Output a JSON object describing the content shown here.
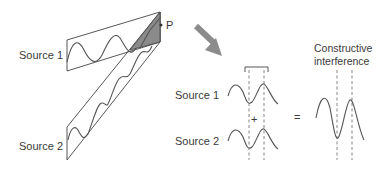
{
  "left_panel": {
    "source1_label": "Source 1",
    "source2_label": "Source 2",
    "point_label": "P"
  },
  "arrow": {
    "icon": "arrow-down-right-icon",
    "color": "#8c8c8c"
  },
  "right_panel": {
    "source1_label": "Source 1",
    "source2_label": "Source 2",
    "plus_sign": "+",
    "equals_sign": "=",
    "result_title_line1": "Constructive",
    "result_title_line2": "interference"
  },
  "colors": {
    "line": "#444444",
    "shading": "#8a8a8a",
    "arrow": "#8c8c8c",
    "text": "#3a3a3a"
  }
}
